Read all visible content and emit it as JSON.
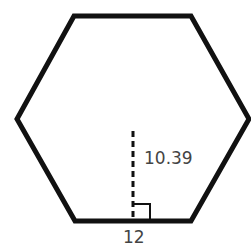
{
  "figure": {
    "shape": "regular hexagon",
    "apothem_label": "10.39",
    "side_label": "12",
    "stroke_color": "#111111",
    "label_color": "#444444"
  }
}
